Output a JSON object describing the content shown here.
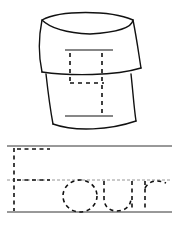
{
  "worksheet": {
    "word": "Four",
    "numeral": "4",
    "picture": "cup",
    "ink_color": "#111111",
    "guide_line_color": "#333333",
    "midline_color": "#888888"
  }
}
